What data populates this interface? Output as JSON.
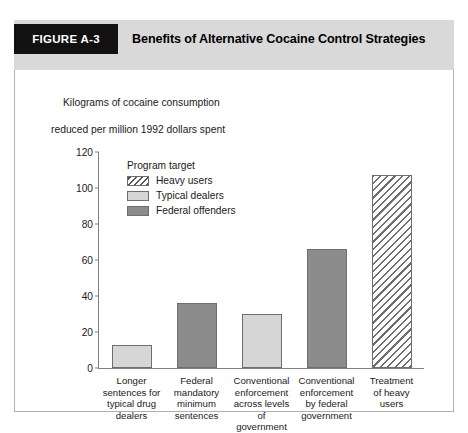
{
  "figure": {
    "tag": "FIGURE A-3",
    "title": "Benefits of Alternative Cocaine Control Strategies"
  },
  "caption": {
    "line1": "Kilograms of cocaine consumption",
    "line2": "reduced per million 1992 dollars spent"
  },
  "legend": {
    "title": "Program target",
    "items": [
      {
        "label": "Heavy users",
        "style": "hatch"
      },
      {
        "label": "Typical dealers",
        "style": "light"
      },
      {
        "label": "Federal offenders",
        "style": "dark"
      }
    ]
  },
  "colors": {
    "header_band": "#d9d9d9",
    "tag_background": "#111111",
    "tag_text": "#ffffff",
    "bar_light": "#d6d6d6",
    "bar_dark": "#8c8c8c",
    "bar_outline": "#6e6e6e",
    "axis": "#808080"
  },
  "chart_data": {
    "type": "bar",
    "title": "Benefits of Alternative Cocaine Control Strategies",
    "subtitle": "Kilograms of cocaine consumption reduced per million 1992 dollars spent",
    "xlabel": "",
    "ylabel": "Kilograms of cocaine consumption reduced per million 1992 dollars spent",
    "ylim": [
      0,
      120
    ],
    "yticks": [
      0,
      20,
      40,
      60,
      80,
      100,
      120
    ],
    "ytick_labels": [
      "0",
      "20",
      "40",
      "60",
      "80",
      "100",
      "120"
    ],
    "grid": false,
    "legend_position": "inside-upper-left",
    "legend_title": "Program target",
    "categories": [
      "Longer\nsentences for\ntypical drug\ndealers",
      "Federal\nmandatory\nminimum\nsentences",
      "Conventional\nenforcement\nacross levels\nof government",
      "Conventional\nenforcement\nby federal\ngovernment",
      "Treatment\nof heavy\nusers"
    ],
    "values": [
      13,
      36,
      30,
      66,
      107
    ],
    "bar_groups": [
      "Typical dealers",
      "Federal offenders",
      "Typical dealers",
      "Federal offenders",
      "Heavy users"
    ],
    "series": [
      {
        "name": "Typical dealers",
        "style": "light",
        "points": [
          {
            "category": "Longer sentences for typical drug dealers",
            "value": 13
          },
          {
            "category": "Conventional enforcement across levels of government",
            "value": 30
          }
        ]
      },
      {
        "name": "Federal offenders",
        "style": "dark",
        "points": [
          {
            "category": "Federal mandatory minimum sentences",
            "value": 36
          },
          {
            "category": "Conventional enforcement by federal government",
            "value": 66
          }
        ]
      },
      {
        "name": "Heavy users",
        "style": "hatch",
        "points": [
          {
            "category": "Treatment of heavy users",
            "value": 107
          }
        ]
      }
    ]
  }
}
